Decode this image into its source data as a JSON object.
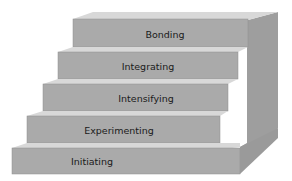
{
  "diagram": {
    "type": "staircase",
    "colors": {
      "front": "#a9a9a9",
      "top": "#d6d6d6",
      "side": "#9b9b9b",
      "edge": "#8a8a8a",
      "text": "#1a1a1a"
    },
    "steps": [
      {
        "label": "Bonding"
      },
      {
        "label": "Integrating"
      },
      {
        "label": "Intensifying"
      },
      {
        "label": "Experimenting"
      },
      {
        "label": "Initiating"
      }
    ]
  }
}
